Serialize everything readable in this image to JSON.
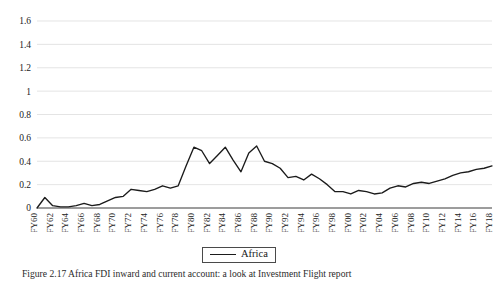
{
  "figure": {
    "caption": "Figure 2.17  Africa FDI inward and current account: a look at Investment Flight report",
    "legend": {
      "position": "bottom-center",
      "entries": [
        {
          "label": "Africa",
          "marker": "line-swatch",
          "color": "#1b1b1b"
        }
      ]
    }
  },
  "chart_data": {
    "type": "line",
    "title": "",
    "xlabel": "",
    "ylabel": "",
    "ylim": [
      0,
      1.6
    ],
    "ytick_values": [
      0,
      0.2,
      0.4,
      0.6,
      0.8,
      1,
      1.2,
      1.4,
      1.6
    ],
    "ytick_labels": [
      "0",
      "0.2",
      "0.4",
      "0.6",
      "0.8",
      "1",
      "1.2",
      "1.4",
      "1.6"
    ],
    "grid": true,
    "grid_axis": "y",
    "xtick_labels": [
      "FY60",
      "FY62",
      "FY64",
      "FY66",
      "FY68",
      "FY70",
      "FY72",
      "FY74",
      "FY76",
      "FY78",
      "FY80",
      "FY82",
      "FY84",
      "FY86",
      "FY88",
      "FY90",
      "FY92",
      "FY94",
      "FY96",
      "FY98",
      "FY00",
      "FY02",
      "FY04",
      "FY06",
      "FY08",
      "FY10",
      "FY12",
      "FY14",
      "FY16",
      "FY18"
    ],
    "x": [
      "FY60",
      "FY61",
      "FY62",
      "FY63",
      "FY64",
      "FY65",
      "FY66",
      "FY67",
      "FY68",
      "FY69",
      "FY70",
      "FY71",
      "FY72",
      "FY73",
      "FY74",
      "FY75",
      "FY76",
      "FY77",
      "FY78",
      "FY79",
      "FY80",
      "FY81",
      "FY82",
      "FY83",
      "FY84",
      "FY85",
      "FY86",
      "FY87",
      "FY88",
      "FY89",
      "FY90",
      "FY91",
      "FY92",
      "FY93",
      "FY94",
      "FY95",
      "FY96",
      "FY97",
      "FY98",
      "FY99",
      "FY00",
      "FY01",
      "FY02",
      "FY03",
      "FY04",
      "FY05",
      "FY06",
      "FY07",
      "FY08",
      "FY09",
      "FY10",
      "FY11",
      "FY12",
      "FY13",
      "FY14",
      "FY15",
      "FY16",
      "FY17",
      "FY18"
    ],
    "series": [
      {
        "name": "Africa",
        "color": "#1b1b1b",
        "values": [
          0.0,
          0.09,
          0.02,
          0.01,
          0.01,
          0.02,
          0.04,
          0.02,
          0.03,
          0.06,
          0.09,
          0.1,
          0.16,
          0.15,
          0.14,
          0.16,
          0.19,
          0.17,
          0.19,
          0.36,
          0.52,
          0.49,
          0.38,
          0.45,
          0.52,
          0.41,
          0.31,
          0.47,
          0.53,
          0.4,
          0.38,
          0.34,
          0.26,
          0.27,
          0.24,
          0.29,
          0.25,
          0.2,
          0.14,
          0.14,
          0.12,
          0.15,
          0.14,
          0.12,
          0.13,
          0.17,
          0.19,
          0.18,
          0.21,
          0.22,
          0.21,
          0.23,
          0.25,
          0.28,
          0.3,
          0.31,
          0.33,
          0.34,
          0.36
        ]
      }
    ],
    "annotations": []
  }
}
